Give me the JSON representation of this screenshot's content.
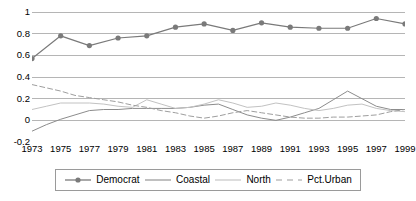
{
  "chart_data": {
    "type": "line",
    "title": "",
    "xlabel": "",
    "ylabel": "",
    "ylim": [
      -0.2,
      1
    ],
    "yticks": [
      "1",
      "0.8",
      "0.6",
      "0.4",
      "0.2",
      "0",
      "-0.2"
    ],
    "ytick_values": [
      1,
      0.8,
      0.6,
      0.4,
      0.2,
      0,
      -0.2
    ],
    "grid": true,
    "legend_position": "bottom",
    "xlim": [
      1973,
      1999
    ],
    "xticks": [
      "1973",
      "1975",
      "1977",
      "1979",
      "1981",
      "1983",
      "1985",
      "1987",
      "1989",
      "1991",
      "1993",
      "1995",
      "1997",
      "1999"
    ],
    "xtick_values": [
      1973,
      1975,
      1977,
      1979,
      1981,
      1983,
      1985,
      1987,
      1989,
      1991,
      1993,
      1995,
      1997,
      1999
    ],
    "x": [
      1973,
      1974,
      1975,
      1976,
      1977,
      1978,
      1979,
      1980,
      1981,
      1982,
      1983,
      1984,
      1985,
      1986,
      1987,
      1988,
      1989,
      1990,
      1991,
      1992,
      1993,
      1994,
      1995,
      1996,
      1997,
      1998,
      1999
    ],
    "series": [
      {
        "name": "Democrat",
        "color": "#7a7a7a",
        "style": "solid-markers",
        "marker": "circle",
        "x": [
          1973,
          1975,
          1977,
          1979,
          1981,
          1983,
          1985,
          1987,
          1989,
          1991,
          1993,
          1995,
          1997,
          1999
        ],
        "values": [
          0.57,
          0.78,
          0.69,
          0.76,
          0.78,
          0.86,
          0.89,
          0.83,
          0.9,
          0.86,
          0.85,
          0.85,
          0.94,
          0.89
        ]
      },
      {
        "name": "Coastal",
        "color": "#8c8c8c",
        "style": "solid",
        "values": [
          -0.1,
          -0.04,
          0.01,
          0.05,
          0.09,
          0.1,
          0.1,
          0.11,
          0.11,
          0.11,
          0.11,
          0.12,
          0.14,
          0.15,
          0.1,
          0.05,
          0.02,
          0.0,
          0.03,
          0.07,
          0.11,
          0.19,
          0.27,
          0.2,
          0.13,
          0.1,
          0.1
        ]
      },
      {
        "name": "North",
        "color": "#c2c2c2",
        "style": "solid",
        "values": [
          0.1,
          0.13,
          0.16,
          0.16,
          0.16,
          0.15,
          0.13,
          0.12,
          0.19,
          0.15,
          0.11,
          0.12,
          0.15,
          0.19,
          0.16,
          0.12,
          0.13,
          0.16,
          0.14,
          0.11,
          0.09,
          0.11,
          0.14,
          0.15,
          0.11,
          0.09,
          0.08
        ]
      },
      {
        "name": "Pct.Urban",
        "color": "#9e9e9e",
        "style": "dashed",
        "values": [
          0.33,
          0.3,
          0.27,
          0.23,
          0.21,
          0.19,
          0.17,
          0.14,
          0.12,
          0.09,
          0.07,
          0.04,
          0.02,
          0.04,
          0.07,
          0.09,
          0.07,
          0.05,
          0.03,
          0.02,
          0.02,
          0.03,
          0.03,
          0.04,
          0.05,
          0.08,
          0.1
        ]
      }
    ]
  },
  "legend": {
    "items": [
      {
        "label": "Democrat"
      },
      {
        "label": "Coastal"
      },
      {
        "label": "North"
      },
      {
        "label": "Pct.Urban"
      }
    ]
  },
  "colors": {
    "gridline": "#b5b5b5",
    "background": "#ffffff",
    "text": "#000000",
    "legend_border": "#9a9a9a"
  }
}
